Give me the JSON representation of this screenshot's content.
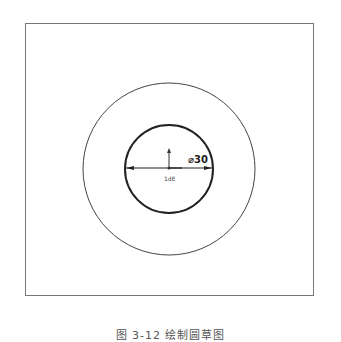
{
  "figure": {
    "caption": "图 3-12 绘制圆草图",
    "caption_is_guess": true,
    "caption_note": "Clipped at the bottom edge and never legible in zooms; inferred from the blurry overview and CAD-tutorial conventions."
  },
  "sketch": {
    "outer_circle": {
      "cx": 169,
      "cy": 169,
      "r": 86
    },
    "inner_circle": {
      "cx": 169,
      "cy": 169,
      "r": 44
    },
    "dimension": {
      "text": "⌀30",
      "symbol": "diameter-icon",
      "value": "30"
    },
    "origin_label": "1dE",
    "origin_label_is_guess": true
  },
  "colors": {
    "line": "#333333",
    "frame": "#777777",
    "caption": "#555555"
  }
}
